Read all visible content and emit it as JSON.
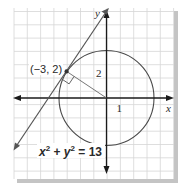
{
  "figure": {
    "type": "coordinate-plane",
    "colors": {
      "grid": "#d4d4d4",
      "axes": "#1a1a1a",
      "circle": "#4a4a4a",
      "tangent_line": "#555555",
      "radius_segment": "#666666",
      "shadow": "#bdbdbd",
      "background": "#ffffff"
    },
    "labels": {
      "x_axis": "x",
      "y_axis": "y",
      "point": "(−3, 2)",
      "y_scale": "2",
      "x_scale": "1",
      "equation_x": "x",
      "equation_sup1": "2",
      "equation_plus": " + ",
      "equation_y": "y",
      "equation_sup2": "2",
      "equation_rhs": " = 13"
    },
    "geometry": {
      "circle_center": [
        0,
        0
      ],
      "circle_radius_squared": 13,
      "tangent_point": [
        -3,
        2
      ],
      "tangent_slope": 1.5,
      "grid_unit": 1
    }
  }
}
